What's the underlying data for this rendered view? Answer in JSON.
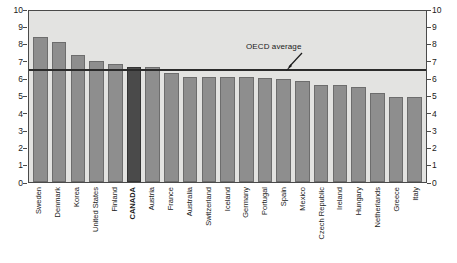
{
  "chart_data": {
    "type": "bar",
    "title": "",
    "subtitle": "",
    "xlabel": "",
    "ylabel": "",
    "ylim": [
      0,
      10
    ],
    "ytick_labels": [
      "10",
      "9",
      "8",
      "7",
      "6",
      "5",
      "4",
      "3",
      "2",
      "1",
      "0"
    ],
    "ytick_values": [
      10,
      9,
      8,
      7,
      6,
      5,
      4,
      3,
      2,
      1,
      0
    ],
    "grid": false,
    "legend": false,
    "dual_axis": true,
    "categories": [
      "Sweden",
      "Denmark",
      "Korea",
      "United States",
      "Finland",
      "CANADA",
      "Austria",
      "France",
      "Australia",
      "Switzerland",
      "Iceland",
      "Germany",
      "Portugal",
      "Spain",
      "Mexico",
      "Czech Republic",
      "Ireland",
      "Hungary",
      "Netherlands",
      "Greece",
      "Italy"
    ],
    "values": [
      8.5,
      8.2,
      7.4,
      7.1,
      6.9,
      6.7,
      6.75,
      6.4,
      6.15,
      6.15,
      6.15,
      6.15,
      6.1,
      6.05,
      5.9,
      5.7,
      5.65,
      5.55,
      5.2,
      5.0,
      5.0
    ],
    "highlight_category": "CANADA",
    "annotations": [
      {
        "name": "oecd-average-line",
        "label": "OECD average",
        "value": 6.5,
        "type": "hline"
      }
    ],
    "colors": {
      "bar": "#8e8e8e",
      "bar_border": "#6d6d6d",
      "highlight_bar": "#4a4a4a",
      "highlight_bar_border": "#343434",
      "plot_background": "#e3e3e1",
      "axis": "#4a4a4a",
      "average_line": "#2b2b2b",
      "text": "#1a1a1a",
      "page_background": "#ffffff"
    }
  }
}
